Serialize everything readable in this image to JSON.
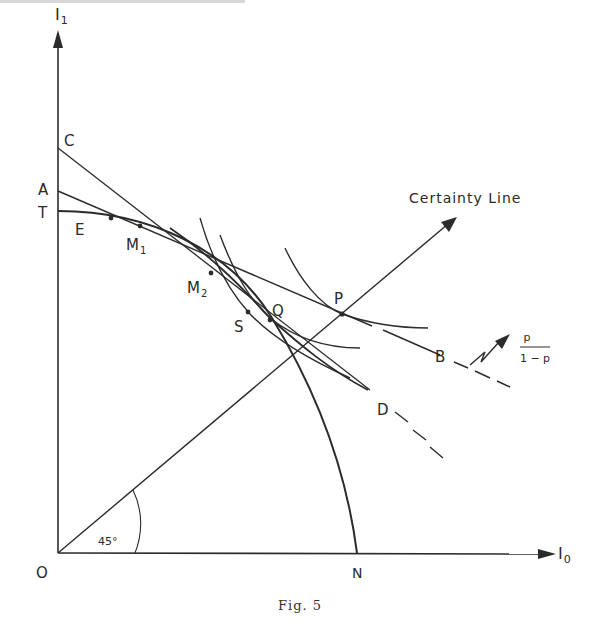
{
  "figure": {
    "caption": "Fig. 5",
    "axes": {
      "y_label": "I",
      "y_label_sub": "1",
      "x_label": "I",
      "x_label_sub": "0",
      "origin_label": "O"
    },
    "points": {
      "C": "C",
      "A": "A",
      "T": "T",
      "E": "E",
      "M1": "M",
      "M1_sub": "1",
      "M2": "M",
      "M2_sub": "2",
      "S": "S",
      "Q": "Q",
      "P": "P",
      "B": "B",
      "D": "D",
      "N": "N"
    },
    "annotations": {
      "certainty_line": "Certainty Line",
      "angle": "45°",
      "slope_numerator": "p",
      "slope_denominator": "1 − p"
    },
    "lines": [
      {
        "name": "certainty-line",
        "from": "O",
        "to": "arrow",
        "angle_deg": 45
      },
      {
        "name": "price-line-AB",
        "from": "A",
        "through": "P",
        "to": "B",
        "dashed_after": "P"
      },
      {
        "name": "line-CD",
        "from": "C",
        "through": "S",
        "to": "D",
        "dashed_after": "D"
      },
      {
        "name": "transformation-curve-TN",
        "from": "T",
        "through": [
          "E",
          "M1",
          "M2",
          "S"
        ],
        "to": "N"
      }
    ],
    "colors": {
      "ink": "#2b2b2b",
      "background": "#ffffff"
    }
  }
}
